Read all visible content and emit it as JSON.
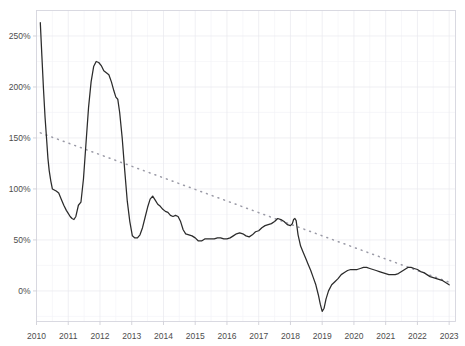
{
  "chart_data": {
    "type": "line",
    "title": "",
    "subtitle": "",
    "xlabel": "",
    "ylabel": "",
    "xlim": [
      2010.0,
      2023.2
    ],
    "ylim": [
      -30,
      275
    ],
    "grid": true,
    "legend": "none",
    "y_tick_labels": [
      "250%",
      "200%",
      "150%",
      "100%",
      "50%",
      "0%"
    ],
    "y_tick_values": [
      250,
      200,
      150,
      100,
      50,
      0
    ],
    "x_tick_labels": [
      "2010",
      "2011",
      "2012",
      "2013",
      "2014",
      "2015",
      "2016",
      "2017",
      "2018",
      "2019",
      "2020",
      "2021",
      "2022",
      "2023"
    ],
    "x_tick_values": [
      2010,
      2011,
      2012,
      2013,
      2014,
      2015,
      2016,
      2017,
      2018,
      2019,
      2020,
      2021,
      2022,
      2023
    ],
    "y_unit": "percent",
    "series": [
      {
        "name": "value",
        "style": "solid",
        "color": "#2b2b2b",
        "x": [
          2010.12,
          2010.17,
          2010.22,
          2010.27,
          2010.32,
          2010.36,
          2010.4,
          2010.45,
          2010.5,
          2010.56,
          2010.62,
          2010.7,
          2010.78,
          2010.86,
          2010.94,
          2011.0,
          2011.06,
          2011.12,
          2011.18,
          2011.24,
          2011.32,
          2011.4,
          2011.48,
          2011.56,
          2011.64,
          2011.72,
          2011.8,
          2011.88,
          2011.96,
          2012.04,
          2012.12,
          2012.2,
          2012.28,
          2012.36,
          2012.44,
          2012.5,
          2012.56,
          2012.62,
          2012.7,
          2012.78,
          2012.86,
          2012.94,
          2013.02,
          2013.1,
          2013.18,
          2013.26,
          2013.34,
          2013.42,
          2013.5,
          2013.58,
          2013.66,
          2013.74,
          2013.82,
          2013.9,
          2013.98,
          2014.06,
          2014.14,
          2014.22,
          2014.3,
          2014.38,
          2014.46,
          2014.54,
          2014.62,
          2014.7,
          2014.8,
          2014.9,
          2015.0,
          2015.1,
          2015.2,
          2015.3,
          2015.4,
          2015.5,
          2015.6,
          2015.7,
          2015.8,
          2015.9,
          2016.0,
          2016.1,
          2016.2,
          2016.3,
          2016.4,
          2016.5,
          2016.6,
          2016.7,
          2016.8,
          2016.9,
          2017.0,
          2017.1,
          2017.2,
          2017.3,
          2017.4,
          2017.5,
          2017.6,
          2017.7,
          2017.8,
          2017.9,
          2018.0,
          2018.06,
          2018.1,
          2018.14,
          2018.18,
          2018.24,
          2018.32,
          2018.4,
          2018.48,
          2018.56,
          2018.64,
          2018.72,
          2018.8,
          2018.88,
          2018.94,
          2019.0,
          2019.06,
          2019.12,
          2019.2,
          2019.3,
          2019.4,
          2019.5,
          2019.6,
          2019.7,
          2019.8,
          2019.9,
          2020.0,
          2020.1,
          2020.2,
          2020.3,
          2020.4,
          2020.5,
          2020.6,
          2020.7,
          2020.8,
          2020.9,
          2021.0,
          2021.1,
          2021.2,
          2021.3,
          2021.4,
          2021.5,
          2021.6,
          2021.7,
          2021.8,
          2021.9,
          2022.0,
          2022.1,
          2022.2,
          2022.3,
          2022.4,
          2022.5,
          2022.6,
          2022.7,
          2022.8,
          2022.9,
          2023.0
        ],
        "y": [
          263,
          230,
          198,
          170,
          148,
          130,
          118,
          108,
          100,
          99,
          98,
          96,
          90,
          84,
          79,
          76,
          73,
          71,
          70,
          73,
          84,
          87,
          110,
          145,
          180,
          205,
          220,
          225,
          224,
          221,
          216,
          214,
          212,
          205,
          196,
          190,
          188,
          175,
          150,
          118,
          88,
          68,
          54,
          52,
          52,
          55,
          62,
          72,
          82,
          90,
          93,
          89,
          85,
          83,
          80,
          78,
          77,
          74,
          73,
          74,
          73,
          68,
          60,
          56,
          55,
          54,
          52,
          49,
          49,
          51,
          51,
          51,
          51,
          52,
          52,
          51,
          51,
          52,
          54,
          56,
          57,
          56,
          54,
          53,
          55,
          58,
          59,
          62,
          64,
          65,
          66,
          68,
          71,
          70,
          68,
          65,
          64,
          66,
          70,
          71,
          69,
          55,
          44,
          38,
          32,
          26,
          20,
          13,
          6,
          -4,
          -13,
          -20,
          -17,
          -8,
          0,
          6,
          9,
          12,
          16,
          18,
          20,
          21,
          21,
          21,
          22,
          23,
          23,
          22,
          21,
          20,
          19,
          18,
          17,
          16,
          16,
          16,
          17,
          19,
          21,
          23,
          23,
          22,
          21,
          19,
          18,
          16,
          14,
          13,
          12,
          11,
          10,
          8,
          6
        ]
      },
      {
        "name": "trend",
        "style": "dotted",
        "color": "#9a9aa6",
        "x": [
          2010.12,
          2023.05
        ],
        "y": [
          155,
          8
        ]
      }
    ]
  }
}
